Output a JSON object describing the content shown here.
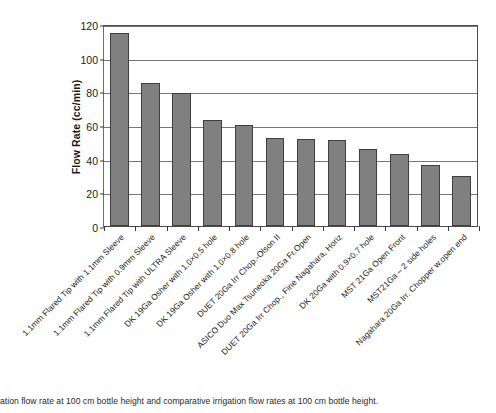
{
  "chart_data": {
    "type": "bar",
    "title": "",
    "xlabel": "",
    "ylabel": "Flow Rate (cc/min)",
    "ylim": [
      0,
      120
    ],
    "ytick_step": 20,
    "yticks": [
      0,
      20,
      40,
      60,
      80,
      100,
      120
    ],
    "grid": true,
    "legend": "none",
    "bar_color": "#808080",
    "bar_edge_color": "#3f3f3f",
    "categories": [
      "1.1mm Flared Tip with 1.1mm Sleeve",
      "1.1mm Flared Tip with 0.9mm Sleeve",
      "1.1mm Flared Tip with ULTRA Sleeve",
      "DK 19Ga Osher with 1.0×0.5 hole",
      "DK 19Ga Osher with 1.0×0.8 hole",
      "DUET 20Ga Irr Chop.-Olson II",
      "ASICO Duo Max Tsuneoka 20Ga Fr.Open",
      "DUET 20Ga Irr Chop., Fine Nagahara, Horiz",
      "DK 20Ga with 0.9×0.7 hole",
      "MST 21Ga Open Front",
      "MST21Ga – 2 side holes",
      "Nagahara 20Ga Irr. Chopper w.open end"
    ],
    "values": [
      114.5,
      85,
      79,
      63,
      60,
      52,
      51.5,
      51,
      45.5,
      43,
      36.5,
      30
    ]
  },
  "caption": {
    "text": "ation flow rate at 100 cm bottle height and comparative irrigation flow rates at 100 cm bottle height."
  }
}
